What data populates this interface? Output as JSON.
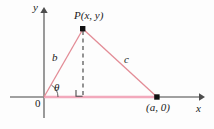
{
  "figure": {
    "axis_labels": {
      "y": "y",
      "x": "x",
      "origin": "0"
    },
    "point_labels": {
      "apex": "P(x, y)",
      "base_right": "(a, 0)"
    },
    "side_labels": {
      "hypotenuse_left": "b",
      "hypotenuse_right": "c"
    },
    "angle_labels": {
      "theta": "θ"
    },
    "colors": {
      "triangle_stroke": "#e38c96",
      "base_stroke": "#f2a9bc",
      "axis_stroke": "#808080",
      "dashed_stroke": "#4d4d4d",
      "point_fill": "#111111",
      "background": "#fdfdfd"
    },
    "geometry": {
      "origin": [
        44,
        97
      ],
      "apex": [
        83,
        29
      ],
      "base_right": [
        157,
        97
      ],
      "foot": [
        83,
        97
      ],
      "x_axis_span": [
        10,
        203
      ],
      "y_axis_span": [
        8,
        118
      ]
    }
  }
}
